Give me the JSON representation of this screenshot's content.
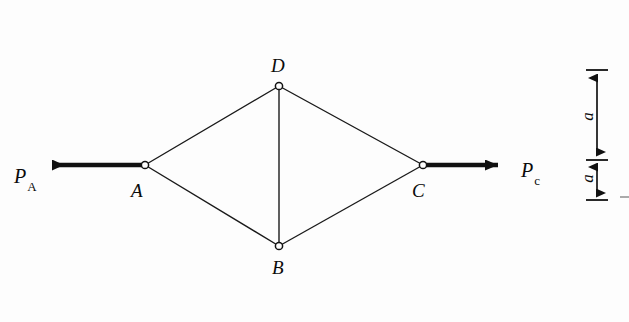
{
  "figure": {
    "type": "statics-truss-free-body-diagram",
    "background_color": "#fdfdfd",
    "line_color": "#1a1a1a",
    "nodes": [
      {
        "id": "A",
        "label": "A",
        "x": 145,
        "y": 165,
        "label_x": 131,
        "label_y": 181
      },
      {
        "id": "B",
        "label": "B",
        "x": 279,
        "y": 246,
        "label_x": 272,
        "label_y": 258
      },
      {
        "id": "C",
        "label": "C",
        "x": 423,
        "y": 165,
        "label_x": 412,
        "label_y": 181
      },
      {
        "id": "D",
        "label": "D",
        "x": 279,
        "y": 86,
        "label_x": 271,
        "label_y": 56
      }
    ],
    "members": [
      {
        "from": "A",
        "to": "D"
      },
      {
        "from": "D",
        "to": "C"
      },
      {
        "from": "A",
        "to": "B"
      },
      {
        "from": "B",
        "to": "C"
      },
      {
        "from": "D",
        "to": "B"
      }
    ],
    "forces": [
      {
        "id": "P_A",
        "symbol": "P",
        "subscript": "A",
        "direction": "left",
        "applied_at": "A",
        "tail_x": 145,
        "tail_y": 165,
        "tip_x": 38,
        "tip_y": 165,
        "label_x": 14,
        "label_y": 166
      },
      {
        "id": "P_c",
        "symbol": "P",
        "subscript": "c",
        "direction": "right",
        "applied_at": "C",
        "tail_x": 423,
        "tail_y": 165,
        "tip_x": 512,
        "tip_y": 165,
        "label_x": 521,
        "label_y": 160
      }
    ],
    "dimensions": {
      "line_x": 597,
      "tick_half_width": 11,
      "segments": [
        {
          "label": "a",
          "y_top": 70,
          "y_bottom": 160,
          "label_x": 583,
          "label_y": 108
        },
        {
          "label": "a",
          "y_top": 160,
          "y_bottom": 200,
          "label_x": 583,
          "label_y": 170
        }
      ],
      "ticks_y": [
        70,
        160,
        200
      ]
    },
    "artifacts": [
      {
        "id": "edge-dash",
        "x": 620,
        "y": 197,
        "width": 9,
        "height": 2
      }
    ]
  }
}
